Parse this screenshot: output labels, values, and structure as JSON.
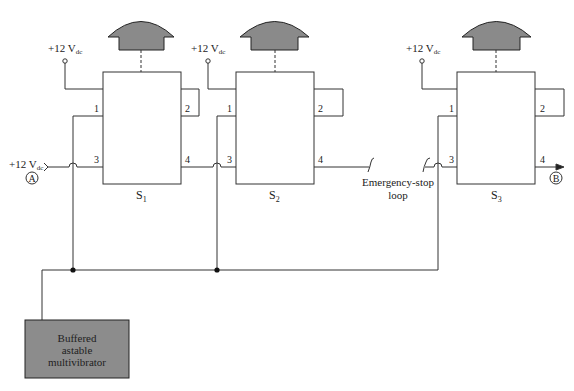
{
  "diagram": {
    "supply_label": "+12 V",
    "supply_subscript": "dc",
    "switches": [
      {
        "name": "S",
        "sub": "1",
        "pins": [
          "1",
          "2",
          "3",
          "4"
        ]
      },
      {
        "name": "S",
        "sub": "2",
        "pins": [
          "1",
          "2",
          "3",
          "4"
        ]
      },
      {
        "name": "S",
        "sub": "3",
        "pins": [
          "1",
          "2",
          "3",
          "4"
        ]
      }
    ],
    "input_node": "A",
    "output_node": "B",
    "loop_label_line1": "Emergency-stop",
    "loop_label_line2": "loop",
    "oscillator": {
      "line1": "Buffered",
      "line2": "astable",
      "line3": "multivibrator"
    },
    "colors": {
      "line": "#333333",
      "fill_gray": "#8c8c8c",
      "button_gray": "#8a8a8a"
    }
  }
}
